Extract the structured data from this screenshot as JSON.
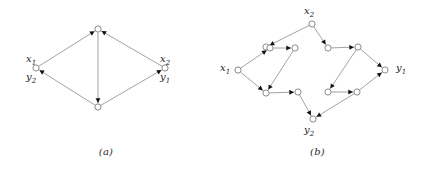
{
  "figure": {
    "panels": [
      {
        "id": "a",
        "caption": "(a)",
        "labels": [
          {
            "name": "x1",
            "text": "x",
            "sub": "1",
            "x": 26,
            "y": 54
          },
          {
            "name": "y2",
            "text": "y",
            "sub": "2",
            "x": 26,
            "y": 72
          },
          {
            "name": "x2",
            "text": "x",
            "sub": "2",
            "x": 160,
            "y": 54
          },
          {
            "name": "y1",
            "text": "y",
            "sub": "1",
            "x": 160,
            "y": 72
          }
        ],
        "nodes": [
          {
            "name": "node-top",
            "cx": 98,
            "cy": 29
          },
          {
            "name": "node-left",
            "cx": 36,
            "cy": 68
          },
          {
            "name": "node-right",
            "cx": 165,
            "cy": 68
          },
          {
            "name": "node-bottom",
            "cx": 98,
            "cy": 107
          }
        ],
        "edges": [
          {
            "name": "edge-left-to-top",
            "from": "node-left",
            "to": "node-top"
          },
          {
            "name": "edge-right-to-top",
            "from": "node-right",
            "to": "node-top"
          },
          {
            "name": "edge-top-to-bottom",
            "from": "node-top",
            "to": "node-bottom"
          },
          {
            "name": "edge-bottom-to-left",
            "from": "node-bottom",
            "to": "node-left"
          },
          {
            "name": "edge-bottom-to-right",
            "from": "node-bottom",
            "to": "node-right"
          }
        ]
      },
      {
        "id": "b",
        "caption": "(b)",
        "labels": [
          {
            "name": "x2",
            "text": "x",
            "sub": "2",
            "x": 92,
            "y": 6
          },
          {
            "name": "x1",
            "text": "x",
            "sub": "1",
            "x": 8,
            "y": 63
          },
          {
            "name": "y1",
            "text": "y",
            "sub": "1",
            "x": 184,
            "y": 63
          },
          {
            "name": "y2",
            "text": "y",
            "sub": "2",
            "x": 92,
            "y": 125
          }
        ],
        "nodes": [
          {
            "name": "node-x2",
            "cx": 100,
            "cy": 24
          },
          {
            "name": "node-x1",
            "cx": 26,
            "cy": 70
          },
          {
            "name": "node-y1",
            "cx": 173,
            "cy": 70
          },
          {
            "name": "node-y2",
            "cx": 101,
            "cy": 119
          },
          {
            "name": "node-u1",
            "cx": 54,
            "cy": 47
          },
          {
            "name": "node-u2",
            "cx": 58,
            "cy": 48
          },
          {
            "name": "node-u3",
            "cx": 83,
            "cy": 48
          },
          {
            "name": "node-u4",
            "cx": 116,
            "cy": 48
          },
          {
            "name": "node-u5",
            "cx": 146,
            "cy": 47
          },
          {
            "name": "node-l1",
            "cx": 54,
            "cy": 93
          },
          {
            "name": "node-l2",
            "cx": 86,
            "cy": 92
          },
          {
            "name": "node-l3",
            "cx": 116,
            "cy": 92
          },
          {
            "name": "node-l4",
            "cx": 145,
            "cy": 92
          }
        ],
        "edges": [
          {
            "name": "edge-x2-to-u1",
            "from": "node-x2",
            "to": "node-u1"
          },
          {
            "name": "edge-x2-to-u4",
            "from": "node-x2",
            "to": "node-u4"
          },
          {
            "name": "edge-x1-to-u2",
            "from": "node-x1",
            "to": "node-u2"
          },
          {
            "name": "edge-x1-to-l1",
            "from": "node-x1",
            "to": "node-l1"
          },
          {
            "name": "edge-u2-to-u3",
            "from": "node-u2",
            "to": "node-u3"
          },
          {
            "name": "edge-u3-to-l1",
            "from": "node-u3",
            "to": "node-l1"
          },
          {
            "name": "edge-u4-to-u5",
            "from": "node-u4",
            "to": "node-u5"
          },
          {
            "name": "edge-u5-to-y1",
            "from": "node-u5",
            "to": "node-y1"
          },
          {
            "name": "edge-u5-to-l3",
            "from": "node-u5",
            "to": "node-l3"
          },
          {
            "name": "edge-l1-to-l2",
            "from": "node-l1",
            "to": "node-l2"
          },
          {
            "name": "edge-l2-to-y2",
            "from": "node-l2",
            "to": "node-y2"
          },
          {
            "name": "edge-l3-to-l4",
            "from": "node-l3",
            "to": "node-l4"
          },
          {
            "name": "edge-l4-to-y1",
            "from": "node-l4",
            "to": "node-y1"
          },
          {
            "name": "edge-l4-to-y2",
            "from": "node-l4",
            "to": "node-y2"
          }
        ]
      }
    ],
    "style": {
      "stroke": "#8a8a8a",
      "node_stroke": "#6f6f6f",
      "node_fill": "#ffffff",
      "arrow_fill": "#111111",
      "node_radius": 3.1,
      "stroke_width": 0.8
    }
  }
}
